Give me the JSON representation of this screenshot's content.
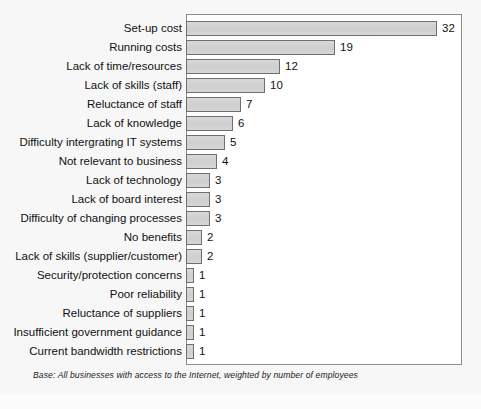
{
  "footnote": "Base: All businesses with access to the Internet, weighted by number of employees",
  "colors": {
    "bar_fill": "#d2d2d2",
    "bar_border": "#6f6f6f",
    "frame_border": "#8d8d8d",
    "page_background": "#f7f7f7",
    "plot_background": "#ffffff",
    "text": "#111111"
  },
  "chart_data": {
    "type": "bar",
    "orientation": "horizontal",
    "title": "",
    "subtitle": "",
    "xlabel": "",
    "ylabel": "",
    "xlim": [
      0,
      35
    ],
    "grid": false,
    "legend": null,
    "data_labels": true,
    "annotations": [
      "Base: All businesses with access to the Internet, weighted by number of employees"
    ],
    "categories": [
      "Set-up cost",
      "Running costs",
      "Lack of time/resources",
      "Lack of skills (staff)",
      "Reluctance of staff",
      "Lack of knowledge",
      "Difficulty intergrating IT systems",
      "Not relevant to business",
      "Lack of technology",
      "Lack of board interest",
      "Difficulty of changing processes",
      "No benefits",
      "Lack of skills (supplier/customer)",
      "Security/protection concerns",
      "Poor reliability",
      "Reluctance of suppliers",
      "Insufficient government guidance",
      "Current bandwidth restrictions"
    ],
    "values": [
      32,
      19,
      12,
      10,
      7,
      6,
      5,
      4,
      3,
      3,
      3,
      2,
      2,
      1,
      1,
      1,
      1,
      1
    ]
  }
}
